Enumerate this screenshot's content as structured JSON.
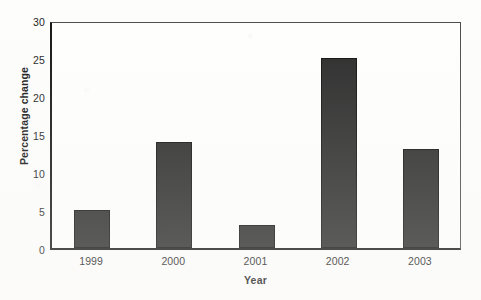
{
  "chart_data": {
    "type": "bar",
    "title": "",
    "subtitle": "",
    "xlabel": "Year",
    "ylabel": "Percentage change",
    "categories": [
      "1999",
      "2000",
      "2001",
      "2002",
      "2003"
    ],
    "values": [
      5,
      14,
      3,
      25,
      13
    ],
    "series": [
      {
        "name": "Percentage change",
        "values": [
          5,
          14,
          3,
          25,
          13
        ]
      }
    ],
    "ylim": [
      0,
      30
    ],
    "y_ticks": [
      0,
      5,
      10,
      15,
      20,
      25,
      30
    ],
    "y_tick_labels": [
      "0",
      "5",
      "10",
      "15",
      "20",
      "25",
      "30"
    ],
    "xlim_categories": 5,
    "grid": false,
    "legend": null,
    "legend_position": "none",
    "annotations": [],
    "bar_color": "#282828",
    "bar_edge_color": "#0d0d0d",
    "axis_color": "#141414",
    "plot_background": "#fefefd",
    "figure_background": "#fdfdfc"
  }
}
